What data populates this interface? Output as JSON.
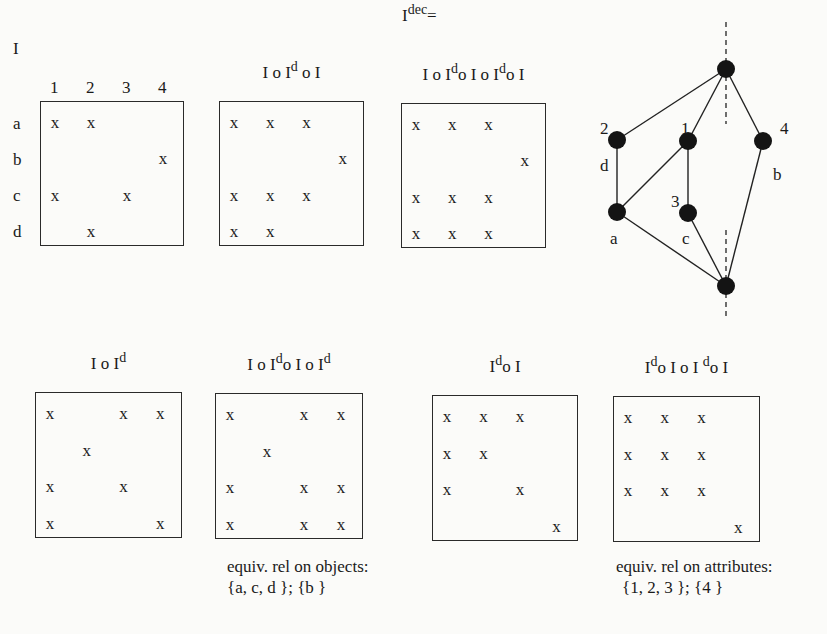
{
  "row_labels": [
    "a",
    "b",
    "c",
    "d"
  ],
  "col_labels": [
    "1",
    "2",
    "3",
    "4"
  ],
  "matrices": [
    {
      "id": "I",
      "title_parts": [
        {
          "t": "I"
        }
      ],
      "box": [
        40,
        101,
        144,
        145
      ],
      "cells": [
        [
          1,
          1,
          0,
          0
        ],
        [
          0,
          0,
          0,
          1
        ],
        [
          1,
          0,
          1,
          0
        ],
        [
          0,
          1,
          0,
          0
        ]
      ]
    },
    {
      "id": "IoIdoI",
      "title_parts": [
        {
          "t": "I o I"
        },
        {
          "s": "d"
        },
        {
          "t": " o I"
        }
      ],
      "box": [
        219,
        101,
        145,
        145
      ],
      "cells": [
        [
          1,
          1,
          1,
          0
        ],
        [
          0,
          0,
          0,
          1
        ],
        [
          1,
          1,
          1,
          0
        ],
        [
          1,
          1,
          0,
          0
        ]
      ]
    },
    {
      "id": "Idec",
      "title_parts": [
        {
          "t": "I o I"
        },
        {
          "s": "d"
        },
        {
          "t": "o I o I"
        },
        {
          "s": "d"
        },
        {
          "t": "o I"
        }
      ],
      "box": [
        401,
        103,
        145,
        145
      ],
      "cells": [
        [
          1,
          1,
          1,
          0
        ],
        [
          0,
          0,
          0,
          1
        ],
        [
          1,
          1,
          1,
          0
        ],
        [
          1,
          1,
          1,
          0
        ]
      ]
    },
    {
      "id": "IoId",
      "title_parts": [
        {
          "t": "I o I"
        },
        {
          "s": "d"
        }
      ],
      "box": [
        35,
        392,
        147,
        146
      ],
      "cells": [
        [
          1,
          0,
          1,
          1
        ],
        [
          0,
          1,
          0,
          0
        ],
        [
          1,
          0,
          1,
          0
        ],
        [
          1,
          0,
          0,
          1
        ]
      ]
    },
    {
      "id": "IoIdoIoId",
      "title_parts": [
        {
          "t": "I o I"
        },
        {
          "s": "d"
        },
        {
          "t": "o I o I"
        },
        {
          "s": "d"
        }
      ],
      "box": [
        215,
        393,
        148,
        146
      ],
      "cells": [
        [
          1,
          0,
          1,
          1
        ],
        [
          0,
          1,
          0,
          0
        ],
        [
          1,
          0,
          1,
          1
        ],
        [
          1,
          0,
          1,
          1
        ]
      ]
    },
    {
      "id": "IdoI",
      "title_parts": [
        {
          "t": "I"
        },
        {
          "s": "d"
        },
        {
          "t": "o I"
        }
      ],
      "box": [
        432,
        395,
        146,
        146
      ],
      "cells": [
        [
          1,
          1,
          1,
          0
        ],
        [
          1,
          1,
          0,
          0
        ],
        [
          1,
          0,
          1,
          0
        ],
        [
          0,
          0,
          0,
          1
        ]
      ]
    },
    {
      "id": "IdoIoIdoI",
      "title_parts": [
        {
          "t": "I"
        },
        {
          "s": "d"
        },
        {
          "t": "o I o I "
        },
        {
          "s": "d"
        },
        {
          "t": "o I"
        }
      ],
      "box": [
        613,
        396,
        147,
        146
      ],
      "cells": [
        [
          1,
          1,
          1,
          0
        ],
        [
          1,
          1,
          1,
          0
        ],
        [
          1,
          1,
          1,
          0
        ],
        [
          0,
          0,
          0,
          1
        ]
      ]
    }
  ],
  "headers": {
    "I": "I",
    "idec_prefix": "I",
    "idec_sup": "dec",
    "idec_eq": "="
  },
  "cell_mark": "x",
  "lattice": {
    "nodes": [
      {
        "id": "top",
        "x": 726,
        "y": 69
      },
      {
        "id": "n2",
        "x": 617,
        "y": 140
      },
      {
        "id": "n1",
        "x": 688,
        "y": 141
      },
      {
        "id": "n4",
        "x": 763,
        "y": 141
      },
      {
        "id": "a",
        "x": 617,
        "y": 212
      },
      {
        "id": "c",
        "x": 688,
        "y": 213
      },
      {
        "id": "bottom",
        "x": 726,
        "y": 286
      }
    ],
    "edges": [
      [
        "top",
        "n2"
      ],
      [
        "top",
        "n1"
      ],
      [
        "top",
        "n4"
      ],
      [
        "n2",
        "a"
      ],
      [
        "n1",
        "a"
      ],
      [
        "n1",
        "c"
      ],
      [
        "a",
        "bottom"
      ],
      [
        "c",
        "bottom"
      ],
      [
        "n4",
        "bottom"
      ]
    ],
    "labels": [
      {
        "text": "2",
        "x": 600,
        "y": 134
      },
      {
        "text": "1",
        "x": 681,
        "y": 134
      },
      {
        "text": "4",
        "x": 780,
        "y": 134
      },
      {
        "text": "d",
        "x": 600,
        "y": 171
      },
      {
        "text": "b",
        "x": 773,
        "y": 180
      },
      {
        "text": "3",
        "x": 671,
        "y": 207
      },
      {
        "text": "a",
        "x": 610,
        "y": 244
      },
      {
        "text": "c",
        "x": 682,
        "y": 244
      }
    ],
    "dashed_axis_x": 726
  },
  "captions": {
    "objects_title": "equiv. rel on objects:",
    "objects_classes": "{a, c, d };  {b }",
    "attributes_title": "equiv. rel on attributes:",
    "attributes_classes": "{1, 2, 3 };  {4 }"
  }
}
